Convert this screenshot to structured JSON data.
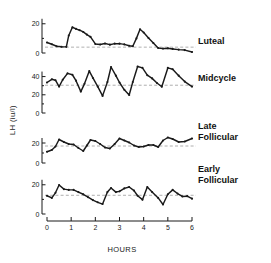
{
  "figure": {
    "y_axis_label": "LH (iu/l)",
    "x_axis_label": "HOURS",
    "x_ticks": [
      "0",
      "1",
      "2",
      "3",
      "4",
      "5",
      "6"
    ],
    "line_color": "#1a1a1a",
    "mean_line_color": "#9a9a9a",
    "background": "#ffffff"
  },
  "chart_data": [
    {
      "type": "line",
      "title": "Luteal",
      "xlabel": "HOURS",
      "ylabel": "LH (iu/l)",
      "xlim": [
        0,
        6
      ],
      "ylim": [
        0,
        26
      ],
      "yticks": [
        0,
        20
      ],
      "grid": false,
      "mean": 4.0,
      "x": [
        0.0,
        0.2,
        0.4,
        0.6,
        0.8,
        0.9,
        1.05,
        1.2,
        1.35,
        1.5,
        1.65,
        1.8,
        2.0,
        2.2,
        2.4,
        2.6,
        2.8,
        3.0,
        3.2,
        3.4,
        3.55,
        3.7,
        3.85,
        4.0,
        4.2,
        4.4,
        4.6,
        4.8,
        5.0,
        5.2,
        5.45,
        5.7,
        6.0
      ],
      "y": [
        7.2,
        6.0,
        4.6,
        4.3,
        4.2,
        12.0,
        17.6,
        16.5,
        15.6,
        14.4,
        12.6,
        11.0,
        6.2,
        5.8,
        6.5,
        5.7,
        6.4,
        6.4,
        5.9,
        5.0,
        4.6,
        10.0,
        16.2,
        14.0,
        10.3,
        6.8,
        3.4,
        3.0,
        3.2,
        2.8,
        2.3,
        2.0,
        0.7
      ]
    },
    {
      "type": "line",
      "title": "Midcycle",
      "xlabel": "HOURS",
      "ylabel": "LH (iu/l)",
      "xlim": [
        0,
        6
      ],
      "ylim": [
        0,
        56
      ],
      "yticks": [
        0,
        20,
        40
      ],
      "grid": false,
      "mean": 30.5,
      "x": [
        0.0,
        0.2,
        0.35,
        0.5,
        0.65,
        0.85,
        1.05,
        1.2,
        1.4,
        1.55,
        1.75,
        1.9,
        2.1,
        2.3,
        2.5,
        2.65,
        2.85,
        3.0,
        3.2,
        3.4,
        3.55,
        3.75,
        3.95,
        4.15,
        4.35,
        4.55,
        4.75,
        5.0,
        5.2,
        5.45,
        5.7,
        6.0
      ],
      "y": [
        33.5,
        37.0,
        36.0,
        29.0,
        36.5,
        43.5,
        42.0,
        35.5,
        23.5,
        32.0,
        46.0,
        38.5,
        29.0,
        18.8,
        34.0,
        50.5,
        41.0,
        33.5,
        25.5,
        19.8,
        34.0,
        51.0,
        49.5,
        41.5,
        38.0,
        33.0,
        28.8,
        49.5,
        48.0,
        41.0,
        34.5,
        29.0
      ]
    },
    {
      "type": "line",
      "title": "Late Follicular",
      "xlabel": "HOURS",
      "ylabel": "LH (iu/l)",
      "xlim": [
        0,
        6
      ],
      "ylim": [
        0,
        30
      ],
      "yticks": [
        0,
        20
      ],
      "grid": false,
      "mean": 17.0,
      "x": [
        0.0,
        0.2,
        0.35,
        0.5,
        0.7,
        0.9,
        1.1,
        1.3,
        1.5,
        1.65,
        1.8,
        2.0,
        2.2,
        2.4,
        2.6,
        2.8,
        3.0,
        3.2,
        3.4,
        3.6,
        3.8,
        4.0,
        4.2,
        4.4,
        4.6,
        4.8,
        5.0,
        5.2,
        5.45,
        5.7,
        6.0
      ],
      "y": [
        11.2,
        13.0,
        16.5,
        23.5,
        21.0,
        19.0,
        18.5,
        15.0,
        12.0,
        17.5,
        23.0,
        22.0,
        19.0,
        15.5,
        14.5,
        19.0,
        24.5,
        22.5,
        20.5,
        17.5,
        16.0,
        16.5,
        18.0,
        18.0,
        16.0,
        22.5,
        25.5,
        24.0,
        21.0,
        21.5,
        24.5
      ]
    },
    {
      "type": "line",
      "title": "Early Follicular",
      "xlabel": "HOURS",
      "ylabel": "LH (iu/l)",
      "xlim": [
        0,
        6
      ],
      "ylim": [
        0,
        26
      ],
      "yticks": [
        0,
        20
      ],
      "grid": false,
      "mean": 12.8,
      "x": [
        0.0,
        0.2,
        0.35,
        0.5,
        0.7,
        0.9,
        1.1,
        1.3,
        1.5,
        1.7,
        1.9,
        2.1,
        2.3,
        2.5,
        2.65,
        2.85,
        3.0,
        3.2,
        3.4,
        3.6,
        3.75,
        3.95,
        4.15,
        4.35,
        4.6,
        4.8,
        5.0,
        5.2,
        5.4,
        5.6,
        5.8,
        6.0
      ],
      "y": [
        12.5,
        11.0,
        14.5,
        19.8,
        17.0,
        16.5,
        16.5,
        15.0,
        13.5,
        11.5,
        9.5,
        8.0,
        6.8,
        15.0,
        17.8,
        15.0,
        15.5,
        17.5,
        18.5,
        16.0,
        12.5,
        9.8,
        18.5,
        15.0,
        11.0,
        6.5,
        13.5,
        16.5,
        14.0,
        12.0,
        12.2,
        10.5
      ]
    }
  ],
  "panel_labels": {
    "luteal": "Luteal",
    "midcycle": "Midcycle",
    "late_follicular_line1": "Late",
    "late_follicular_line2": "Follicular",
    "early_follicular_line1": "Early",
    "early_follicular_line2": "Follicular"
  }
}
